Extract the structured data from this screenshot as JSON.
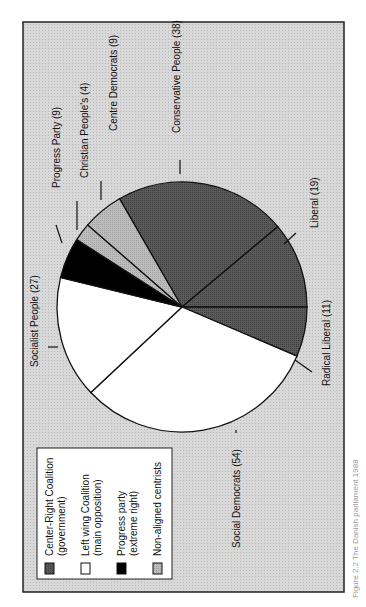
{
  "chart_data": {
    "type": "pie",
    "title": "",
    "caption": "Figure 2.2 The Danish parliament 1988",
    "total_seats": 171,
    "slices": [
      {
        "label": "Conservative People (38)",
        "name": "Conservative People",
        "value": 38,
        "group": "center_right"
      },
      {
        "label": "Liberal (19)",
        "name": "Liberal",
        "value": 19,
        "group": "center_right"
      },
      {
        "label": "Radical Liberal (11)",
        "name": "Radical Liberal",
        "value": 11,
        "group": "center_right"
      },
      {
        "label": "Social Democrats (54)",
        "name": "Social Democrats",
        "value": 54,
        "group": "left_wing"
      },
      {
        "label": "Socialist People (27)",
        "name": "Socialist People",
        "value": 27,
        "group": "left_wing"
      },
      {
        "label": "Progress Party (9)",
        "name": "Progress Party",
        "value": 9,
        "group": "progress"
      },
      {
        "label": "Christian People's (4)",
        "name": "Christian People's",
        "value": 4,
        "group": "non_aligned"
      },
      {
        "label": "Centre Democrats (9)",
        "name": "Centre Democrats",
        "value": 9,
        "group": "non_aligned"
      }
    ],
    "legend": [
      {
        "key": "center_right",
        "line1": "Center-Right Coalition",
        "line2": "(government)",
        "color": "#555555"
      },
      {
        "key": "left_wing",
        "line1": "Left wing Coalition",
        "line2": "(main opposition)",
        "color": "#ffffff"
      },
      {
        "key": "progress",
        "line1": "Progress party",
        "line2": "(extreme right)",
        "color": "#000000"
      },
      {
        "key": "non_aligned",
        "line1": "Non-aligned centrists",
        "line2": "",
        "color": "#b4b4b4"
      }
    ],
    "orientation": "rotated 90 degrees (text reads bottom-to-top)",
    "legend_position": "bottom-left"
  },
  "colors": {
    "background": "#ffffff",
    "frame_fill": "#d4d4d4",
    "frame_stroke": "#222222"
  }
}
